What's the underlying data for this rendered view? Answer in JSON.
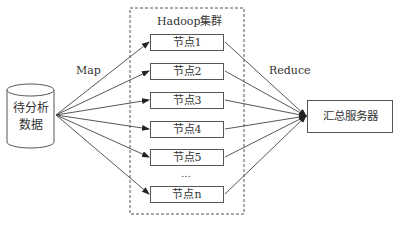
{
  "diagram": {
    "source": {
      "label_line1": "待分析",
      "label_line2": "数据",
      "shape": "cylinder"
    },
    "cluster": {
      "title": "Hadoop集群",
      "border": "dashed"
    },
    "nodes": [
      {
        "label": "节点1"
      },
      {
        "label": "节点2"
      },
      {
        "label": "节点3"
      },
      {
        "label": "节点4"
      },
      {
        "label": "节点5"
      },
      {
        "label": "节点n"
      }
    ],
    "ellipsis": "…",
    "target": {
      "label": "汇总服务器"
    },
    "edges": {
      "map_label": "Map",
      "reduce_label": "Reduce"
    },
    "colors": {
      "line": "#444444",
      "background": "#ffffff"
    }
  }
}
